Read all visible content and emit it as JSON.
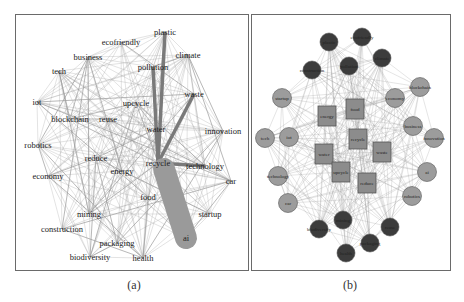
{
  "figure": {
    "panels": [
      {
        "id": "a",
        "caption": "(a)"
      },
      {
        "id": "b",
        "caption": "(b)"
      }
    ]
  },
  "panel_a": {
    "nodes": [
      {
        "label": "plastic",
        "x": 165,
        "y": 32
      },
      {
        "label": "ecofriendly",
        "x": 121,
        "y": 42
      },
      {
        "label": "business",
        "x": 88,
        "y": 57
      },
      {
        "label": "climate",
        "x": 188,
        "y": 55
      },
      {
        "label": "pollution",
        "x": 153,
        "y": 67
      },
      {
        "label": "tech",
        "x": 59,
        "y": 71
      },
      {
        "label": "iot",
        "x": 37,
        "y": 102
      },
      {
        "label": "waste",
        "x": 194,
        "y": 94
      },
      {
        "label": "upcycle",
        "x": 136,
        "y": 103
      },
      {
        "label": "blockchain",
        "x": 70,
        "y": 119
      },
      {
        "label": "reuse",
        "x": 108,
        "y": 119
      },
      {
        "label": "innovation",
        "x": 223,
        "y": 131
      },
      {
        "label": "water",
        "x": 156,
        "y": 129
      },
      {
        "label": "robotics",
        "x": 38,
        "y": 145
      },
      {
        "label": "reduce",
        "x": 96,
        "y": 158
      },
      {
        "label": "recycle",
        "x": 158,
        "y": 163
      },
      {
        "label": "energy",
        "x": 122,
        "y": 171
      },
      {
        "label": "technology",
        "x": 205,
        "y": 166
      },
      {
        "label": "economy",
        "x": 48,
        "y": 176
      },
      {
        "label": "car",
        "x": 231,
        "y": 181
      },
      {
        "label": "food",
        "x": 148,
        "y": 197
      },
      {
        "label": "startup",
        "x": 210,
        "y": 214
      },
      {
        "label": "mining",
        "x": 89,
        "y": 214
      },
      {
        "label": "construction",
        "x": 62,
        "y": 229
      },
      {
        "label": "ai",
        "x": 186,
        "y": 238
      },
      {
        "label": "packaging",
        "x": 117,
        "y": 243
      },
      {
        "label": "biodiversity",
        "x": 90,
        "y": 257
      },
      {
        "label": "health",
        "x": 143,
        "y": 258
      }
    ],
    "thick_edges": [
      [
        "plastic",
        "recycle"
      ],
      [
        "waste",
        "recycle"
      ],
      [
        "pollution",
        "recycle"
      ],
      [
        "recycle",
        "technology"
      ]
    ],
    "blob": {
      "from": "recycle",
      "to": "ai",
      "color": "#9a9a9a"
    }
  },
  "panel_b": {
    "nodes": [
      {
        "label": "plastic",
        "x": 329,
        "y": 42,
        "shape": "dark-circle"
      },
      {
        "label": "ecofriendly",
        "x": 362,
        "y": 37,
        "shape": "dark-circle"
      },
      {
        "label": "climate",
        "x": 382,
        "y": 58,
        "shape": "dark-circle"
      },
      {
        "label": "pollution",
        "x": 349,
        "y": 66,
        "shape": "dark-circle"
      },
      {
        "label": "construction",
        "x": 312,
        "y": 70,
        "shape": "dark-circle"
      },
      {
        "label": "blockchain",
        "x": 420,
        "y": 87,
        "shape": "circle"
      },
      {
        "label": "startup",
        "x": 282,
        "y": 98,
        "shape": "circle"
      },
      {
        "label": "economy",
        "x": 395,
        "y": 98,
        "shape": "circle"
      },
      {
        "label": "food",
        "x": 355,
        "y": 109,
        "shape": "square"
      },
      {
        "label": "energy",
        "x": 327,
        "y": 116,
        "shape": "square"
      },
      {
        "label": "business",
        "x": 413,
        "y": 126,
        "shape": "circle"
      },
      {
        "label": "innovation",
        "x": 434,
        "y": 138,
        "shape": "circle"
      },
      {
        "label": "iot",
        "x": 289,
        "y": 137,
        "shape": "circle"
      },
      {
        "label": "tech",
        "x": 265,
        "y": 138,
        "shape": "circle"
      },
      {
        "label": "recycle",
        "x": 358,
        "y": 139,
        "shape": "square"
      },
      {
        "label": "waste",
        "x": 382,
        "y": 152,
        "shape": "square"
      },
      {
        "label": "water",
        "x": 324,
        "y": 154,
        "shape": "square"
      },
      {
        "label": "ai",
        "x": 427,
        "y": 172,
        "shape": "circle"
      },
      {
        "label": "technology",
        "x": 278,
        "y": 176,
        "shape": "circle"
      },
      {
        "label": "upcycle",
        "x": 341,
        "y": 172,
        "shape": "square"
      },
      {
        "label": "reduce",
        "x": 367,
        "y": 183,
        "shape": "square"
      },
      {
        "label": "robotics",
        "x": 412,
        "y": 196,
        "shape": "circle"
      },
      {
        "label": "car",
        "x": 288,
        "y": 203,
        "shape": "circle"
      },
      {
        "label": "mining",
        "x": 343,
        "y": 220,
        "shape": "dark-circle"
      },
      {
        "label": "biodiversity",
        "x": 319,
        "y": 229,
        "shape": "dark-circle"
      },
      {
        "label": "reuse",
        "x": 390,
        "y": 227,
        "shape": "dark-circle"
      },
      {
        "label": "packaging",
        "x": 370,
        "y": 243,
        "shape": "dark-circle"
      },
      {
        "label": "health",
        "x": 346,
        "y": 253,
        "shape": "dark-circle"
      }
    ],
    "colors": {
      "dark": "#3c3c3c",
      "circle": "#9c9c9c",
      "square": "#8c8c8c",
      "edge": "#9a9a9a"
    }
  }
}
